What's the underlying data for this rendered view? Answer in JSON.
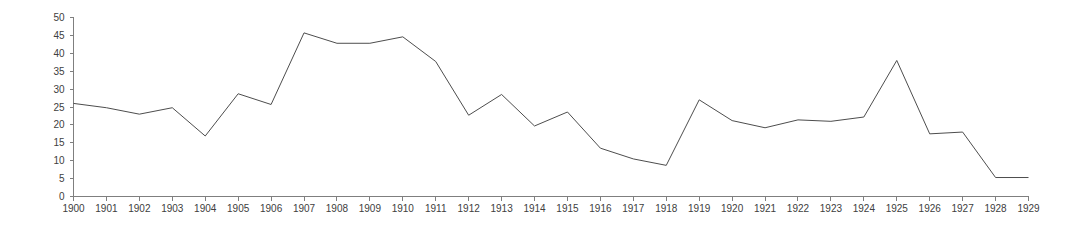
{
  "chart_data": {
    "type": "line",
    "title": "",
    "subtitle": "",
    "xlabel": "",
    "ylabel": "",
    "xlim": [
      1900,
      1929
    ],
    "ylim": [
      0,
      50
    ],
    "grid": false,
    "legend": "none",
    "line_color": "#4d4d4d",
    "axis_color": "#7f7f7f",
    "tick_label_color": "#404040",
    "background_color": "#ffffff",
    "y_ticks": [
      0,
      5,
      10,
      15,
      20,
      25,
      30,
      35,
      40,
      45,
      50
    ],
    "y_tick_labels": [
      "0",
      "5",
      "10",
      "15",
      "20",
      "25",
      "30",
      "35",
      "40",
      "45",
      "50"
    ],
    "categories": [
      "1900",
      "1901",
      "1902",
      "1903",
      "1904",
      "1905",
      "1906",
      "1907",
      "1908",
      "1909",
      "1910",
      "1911",
      "1912",
      "1913",
      "1914",
      "1915",
      "1916",
      "1917",
      "1918",
      "1919",
      "1920",
      "1921",
      "1922",
      "1923",
      "1924",
      "1925",
      "1926",
      "1927",
      "1928",
      "1929"
    ],
    "x": [
      1900,
      1901,
      1902,
      1903,
      1904,
      1905,
      1906,
      1907,
      1908,
      1909,
      1910,
      1911,
      1912,
      1913,
      1914,
      1915,
      1916,
      1917,
      1918,
      1919,
      1920,
      1921,
      1922,
      1923,
      1924,
      1925,
      1926,
      1927,
      1928,
      1929
    ],
    "values": [
      26.0,
      24.8,
      23.0,
      24.8,
      16.9,
      28.7,
      25.7,
      45.7,
      42.8,
      42.8,
      44.6,
      37.7,
      22.7,
      28.5,
      19.7,
      23.6,
      13.5,
      10.5,
      8.7,
      27.0,
      21.2,
      19.2,
      21.4,
      21.0,
      22.2,
      38.0,
      17.5,
      18.0,
      5.3,
      5.3
    ],
    "series": [
      {
        "name": "series-1",
        "values": [
          26.0,
          24.8,
          23.0,
          24.8,
          16.9,
          28.7,
          25.7,
          45.7,
          42.8,
          42.8,
          44.6,
          37.7,
          22.7,
          28.5,
          19.7,
          23.6,
          13.5,
          10.5,
          8.7,
          27.0,
          21.2,
          19.2,
          21.4,
          21.0,
          22.2,
          38.0,
          17.5,
          18.0,
          5.3,
          5.3
        ]
      }
    ]
  }
}
